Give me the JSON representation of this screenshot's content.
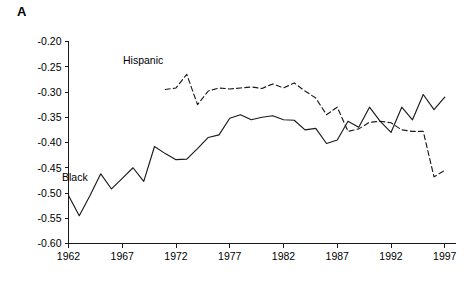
{
  "figure": {
    "panel_label": "A",
    "background_color": "#ffffff",
    "line_color": "#1a1a1a"
  },
  "annotations": [
    {
      "name": "hispanic-series-label",
      "text": "Hispanic"
    },
    {
      "name": "black-series-label",
      "text": "Black"
    }
  ],
  "chart_data": {
    "type": "line",
    "title": "A",
    "xlabel": "",
    "ylabel": "",
    "xlim": [
      1962,
      1998
    ],
    "ylim": [
      -0.6,
      -0.2
    ],
    "grid": false,
    "legend_position": "inline-annotations",
    "xticks": [
      1962,
      1967,
      1972,
      1977,
      1982,
      1987,
      1992,
      1997
    ],
    "xticklabels": [
      "1962",
      "1967",
      "1972",
      "1977",
      "1982",
      "1987",
      "1992",
      "1997"
    ],
    "yticks": [
      -0.2,
      -0.25,
      -0.3,
      -0.35,
      -0.4,
      -0.45,
      -0.5,
      -0.55,
      -0.6
    ],
    "yticklabels": [
      "-0.20",
      "-0.25",
      "-0.30",
      "-0.35",
      "-0.40",
      "-0.45",
      "-0.50",
      "-0.55",
      "-0.60"
    ],
    "series": [
      {
        "name": "Black",
        "style": "solid",
        "x": [
          1962,
          1963,
          1964,
          1965,
          1966,
          1967,
          1968,
          1969,
          1970,
          1971,
          1972,
          1973,
          1974,
          1975,
          1976,
          1977,
          1978,
          1979,
          1980,
          1981,
          1982,
          1983,
          1984,
          1985,
          1986,
          1987,
          1988,
          1989,
          1990,
          1991,
          1992,
          1993,
          1994,
          1995,
          1996,
          1997
        ],
        "values": [
          -0.505,
          -0.545,
          -0.505,
          -0.462,
          -0.492,
          -0.471,
          -0.45,
          -0.477,
          -0.408,
          -0.422,
          -0.434,
          -0.433,
          -0.412,
          -0.39,
          -0.385,
          -0.352,
          -0.345,
          -0.355,
          -0.35,
          -0.347,
          -0.355,
          -0.356,
          -0.375,
          -0.372,
          -0.402,
          -0.395,
          -0.358,
          -0.37,
          -0.33,
          -0.358,
          -0.38,
          -0.33,
          -0.355,
          -0.305,
          -0.335,
          -0.31
        ]
      },
      {
        "name": "Hispanic",
        "style": "dashed",
        "x": [
          1971,
          1972,
          1973,
          1974,
          1975,
          1976,
          1977,
          1978,
          1979,
          1980,
          1981,
          1982,
          1983,
          1984,
          1985,
          1986,
          1987,
          1988,
          1989,
          1990,
          1991,
          1992,
          1993,
          1994,
          1995,
          1996,
          1997
        ],
        "values": [
          -0.295,
          -0.292,
          -0.265,
          -0.325,
          -0.298,
          -0.292,
          -0.294,
          -0.292,
          -0.29,
          -0.293,
          -0.284,
          -0.292,
          -0.282,
          -0.298,
          -0.312,
          -0.345,
          -0.33,
          -0.378,
          -0.373,
          -0.36,
          -0.358,
          -0.361,
          -0.375,
          -0.378,
          -0.378,
          -0.468,
          -0.455
        ]
      }
    ]
  }
}
